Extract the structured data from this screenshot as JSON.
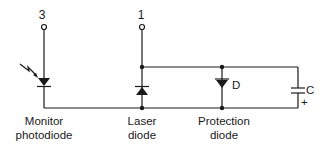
{
  "diagram": {
    "type": "circuit-schematic",
    "colors": {
      "ink": "#1a1a1a",
      "background": "#ffffff"
    },
    "pins": [
      {
        "id": "pin-3",
        "label": "3"
      },
      {
        "id": "pin-1",
        "label": "1"
      }
    ],
    "components": {
      "monitor_photodiode": {
        "line1": "Monitor",
        "line2": "photodiode"
      },
      "laser_diode": {
        "line1": "Laser",
        "line2": "diode"
      },
      "protection_diode": {
        "symbol_label": "D",
        "line1": "Protection",
        "line2": "diode"
      },
      "capacitor": {
        "symbol_label": "C",
        "polarity": "+"
      }
    }
  }
}
